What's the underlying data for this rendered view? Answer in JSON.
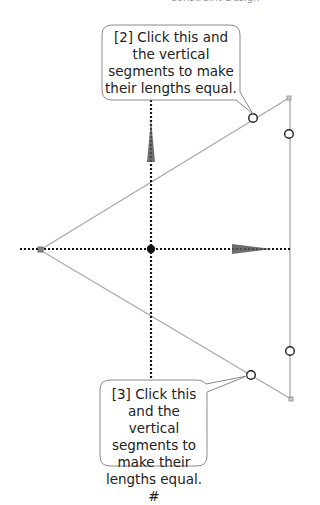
{
  "header": {
    "text": "Constraint Design"
  },
  "callouts": [
    {
      "id": 2,
      "text": "[2] Click this and the vertical segments to make their lengths equal."
    },
    {
      "id": 3,
      "text": "[3] Click this and the vertical segments to make their lengths equal. #"
    }
  ],
  "colors": {
    "line": "#a9a9a9",
    "dotted": "#111111",
    "handle_fill": "#ffffff",
    "handle_stroke": "#222222",
    "arrow": "#555555",
    "callout_border": "#8a8a8a"
  }
}
